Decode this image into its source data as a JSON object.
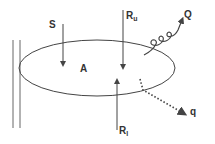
{
  "diagram": {
    "labels": {
      "S": "S",
      "A": "A",
      "Ru_main": "R",
      "Ru_sub": "u",
      "Rl_main": "R",
      "Rl_sub": "l",
      "Q": "Q",
      "q": "q"
    },
    "colors": {
      "stroke": "#444444",
      "text": "#333333"
    }
  }
}
